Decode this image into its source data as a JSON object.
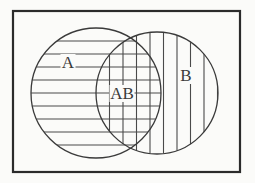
{
  "figure": {
    "type": "venn-diagram",
    "title": "",
    "background_color": "#fbfbf9",
    "stroke_color": "#3a3a3a",
    "frame_color": "#2b2b2b",
    "hatch_color": "#4a4a4a"
  },
  "frame": {
    "x": 13,
    "y": 11,
    "width": 227,
    "height": 161,
    "stroke_width": 2.2
  },
  "sets": [
    {
      "id": "A",
      "label": "A",
      "label_x": 68,
      "label_y": 68,
      "cx": 96,
      "cy": 93,
      "r": 65,
      "fill_pattern": "horizontal-lines",
      "hatch_spacing": 13,
      "hatch_count": 10
    },
    {
      "id": "B",
      "label": "B",
      "label_x": 186,
      "label_y": 81,
      "cx": 157,
      "cy": 93,
      "r": 61,
      "fill_pattern": "vertical-lines",
      "hatch_spacing": 13.5,
      "hatch_count": 9
    }
  ],
  "intersection": {
    "id": "AB",
    "label": "AB",
    "label_x": 122,
    "label_y": 99,
    "fill_pattern": "cross-hatch"
  },
  "labels": {
    "set_a": "A",
    "set_b": "B",
    "intersection": "AB"
  }
}
